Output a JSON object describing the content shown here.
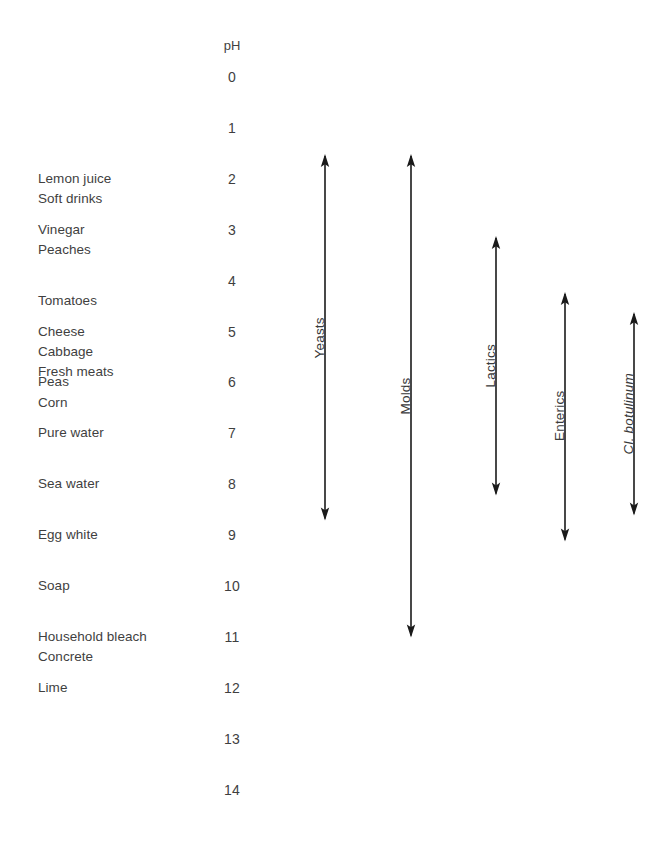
{
  "diagram": {
    "ph_axis": {
      "header": "pH",
      "ticks": [
        "0",
        "1",
        "2",
        "3",
        "4",
        "5",
        "6",
        "7",
        "8",
        "9",
        "10",
        "11",
        "12",
        "13",
        "14"
      ]
    },
    "substances": [
      {
        "label": "Lemon juice",
        "ph": 2.0
      },
      {
        "label": "Soft drinks",
        "ph": 2.4
      },
      {
        "label": "Vinegar",
        "ph": 3.0
      },
      {
        "label": "Peaches",
        "ph": 3.4
      },
      {
        "label": "Tomatoes",
        "ph": 4.4
      },
      {
        "label": "Cheese",
        "ph": 5.0
      },
      {
        "label": "Cabbage",
        "ph": 5.4
      },
      {
        "label": "Fresh meats",
        "ph": 5.8
      },
      {
        "label": "Peas",
        "ph": 6.0
      },
      {
        "label": "Corn",
        "ph": 6.4
      },
      {
        "label": "Pure water",
        "ph": 7.0
      },
      {
        "label": "Sea water",
        "ph": 8.0
      },
      {
        "label": "Egg white",
        "ph": 9.0
      },
      {
        "label": "Soap",
        "ph": 10.0
      },
      {
        "label": "Household bleach",
        "ph": 11.0
      },
      {
        "label": "Concrete",
        "ph": 11.4
      },
      {
        "label": "Lime",
        "ph": 12.0
      }
    ],
    "organisms": [
      {
        "label": "Yeasts",
        "ph_min": 1.5,
        "ph_max": 8.7,
        "italic": false
      },
      {
        "label": "Molds",
        "ph_min": 1.5,
        "ph_max": 11.0,
        "italic": false
      },
      {
        "label": "Lactics",
        "ph_min": 3.1,
        "ph_max": 8.2,
        "italic": false
      },
      {
        "label": "Enterics",
        "ph_min": 4.2,
        "ph_max": 9.1,
        "italic": false
      },
      {
        "label": "Cl. botulinum",
        "ph_min": 4.6,
        "ph_max": 8.6,
        "italic": true
      }
    ],
    "colors": {
      "text": "#3f3f3f",
      "arrow": "#1a1a1a",
      "background": "#ffffff"
    }
  },
  "chart_data": {
    "type": "range-scale",
    "xlabel": "",
    "ylabel": "pH",
    "ylim": [
      0,
      14
    ],
    "grid": false,
    "legend": "none",
    "axis_ticks": [
      0,
      1,
      2,
      3,
      4,
      5,
      6,
      7,
      8,
      9,
      10,
      11,
      12,
      13,
      14
    ],
    "point_annotations": [
      {
        "name": "Lemon juice",
        "ph": 2.0
      },
      {
        "name": "Soft drinks",
        "ph": 2.4
      },
      {
        "name": "Vinegar",
        "ph": 3.0
      },
      {
        "name": "Peaches",
        "ph": 3.4
      },
      {
        "name": "Tomatoes",
        "ph": 4.4
      },
      {
        "name": "Cheese",
        "ph": 5.0
      },
      {
        "name": "Cabbage",
        "ph": 5.4
      },
      {
        "name": "Fresh meats",
        "ph": 5.8
      },
      {
        "name": "Peas",
        "ph": 6.0
      },
      {
        "name": "Corn",
        "ph": 6.4
      },
      {
        "name": "Pure water",
        "ph": 7.0
      },
      {
        "name": "Sea water",
        "ph": 8.0
      },
      {
        "name": "Egg white",
        "ph": 9.0
      },
      {
        "name": "Soap",
        "ph": 10.0
      },
      {
        "name": "Household bleach",
        "ph": 11.0
      },
      {
        "name": "Concrete",
        "ph": 11.4
      },
      {
        "name": "Lime",
        "ph": 12.0
      }
    ],
    "ranges": [
      {
        "name": "Yeasts",
        "min": 1.5,
        "max": 8.7
      },
      {
        "name": "Molds",
        "min": 1.5,
        "max": 11.0
      },
      {
        "name": "Lactics",
        "min": 3.1,
        "max": 8.2
      },
      {
        "name": "Enterics",
        "min": 4.2,
        "max": 9.1
      },
      {
        "name": "Cl. botulinum",
        "min": 4.6,
        "max": 8.6
      }
    ]
  }
}
